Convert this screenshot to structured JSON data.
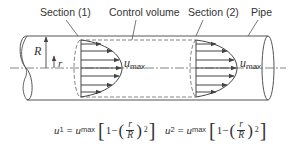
{
  "diagram": {
    "type": "pipe flow control volume",
    "labels": {
      "section1": "Section (1)",
      "control_volume": "Control volume",
      "section2": "Section (2)",
      "pipe": "Pipe"
    },
    "symbols": {
      "radius": "R",
      "r": "r",
      "umax_1": "u",
      "umax_1_sub": "max",
      "umax_2": "u",
      "umax_2_sub": "max"
    },
    "equations": {
      "eq1": {
        "lhs": "u",
        "lhs_sub": "1",
        "eq": " = ",
        "umax": "u",
        "umax_sub": "max",
        "one_minus": "1−",
        "num": "r",
        "den": "R",
        "exp": "2"
      },
      "eq2": {
        "lhs": "u",
        "lhs_sub": "2",
        "eq": " = ",
        "umax": "u",
        "umax_sub": "max",
        "one_minus": "1−",
        "num": "r",
        "den": "R",
        "exp": "2"
      }
    },
    "colors": {
      "line": "#444444",
      "text": "#333333",
      "background": "#ffffff"
    }
  }
}
